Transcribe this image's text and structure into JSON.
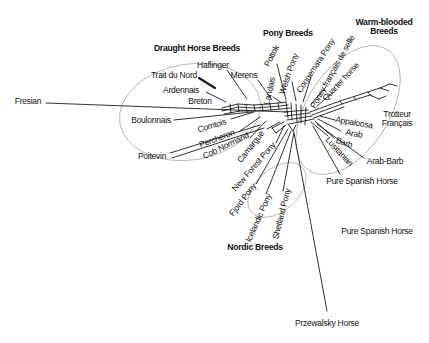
{
  "figure": {
    "type": "phylogenetic-network-diagram",
    "headers": {
      "draught": "Draught Horse Breeds",
      "pony": "Pony Breeds",
      "warm": "Warm-blooded Breeds",
      "nordic": "Nordic Breeds"
    },
    "labels": {
      "fresian": "Fresian",
      "trait_du_nord": "Trait du Nord",
      "haflinger": "Haflinger",
      "ardennais": "Ardennais",
      "breton": "Breton",
      "boulonnais": "Boulonnais",
      "poitevin": "Poitevin",
      "comtois": "Comtois",
      "percheron": "Percheron",
      "cob_normand": "Cob Normand",
      "camargue": "Camargue",
      "new_forest_pony": "New Forest Pony",
      "merens": "Merens",
      "pottok": "Pottok",
      "landais": "Landais",
      "welsh_pony": "Welsh Pony",
      "connemara_pony": "Connemara Pony",
      "poney_francais_de_selle": "Poney français de selle",
      "quarter_horse": "Quarter horse",
      "fjord_pony": "Fjord Pony",
      "icelandic_pony": "Icelandic Pony",
      "shetland_pony": "Shetland Pony",
      "przewalsky_horse": "Przewalsky Horse",
      "appaloosa": "Appaloosa",
      "arab": "Arab",
      "barb": "Barb",
      "lusitanian": "Lusitanian",
      "arab_barb": "Arab-Barb",
      "pure_spanish_horse": "Pure Spanish Horse",
      "pure_spanish_horse_2": "Pure Spanish Horse",
      "trotteur_francais": "Trotteur Français"
    },
    "colors": {
      "line": "#1a1a1a",
      "group_ellipse": "#b3b3b3",
      "text": "#111111",
      "background": "#ffffff"
    }
  }
}
